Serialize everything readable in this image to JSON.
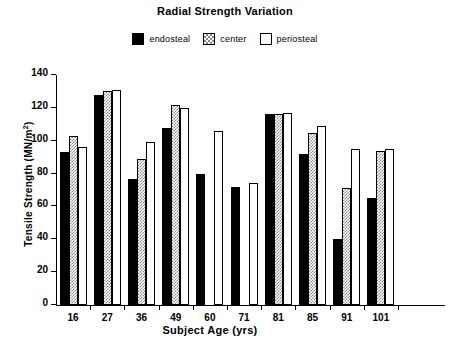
{
  "chart_data": {
    "type": "bar",
    "title": "Radial Strength Variation",
    "xlabel": "Subject Age (yrs)",
    "ylabel": "Tensile Strength (MN/m2)",
    "ylabel_base": "Tensile Strength (MN/m",
    "ylabel_sup": "2",
    "ylabel_close": ")",
    "categories": [
      "16",
      "27",
      "36",
      "49",
      "60",
      "71",
      "81",
      "85",
      "91",
      "101"
    ],
    "ylim": [
      0,
      140
    ],
    "yticks": [
      0,
      20,
      40,
      60,
      80,
      100,
      120,
      140
    ],
    "grid": false,
    "legend_position": "top-center",
    "series": [
      {
        "name": "endosteal",
        "color": "#000000",
        "pattern": "solid",
        "values": [
          93,
          128,
          77,
          108,
          80,
          72,
          116,
          92,
          40,
          65
        ]
      },
      {
        "name": "center",
        "color": "#8a8a8a",
        "pattern": "checkered",
        "values": [
          103,
          130,
          89,
          122,
          null,
          null,
          116,
          105,
          71,
          94
        ]
      },
      {
        "name": "periosteal",
        "color": "#ffffff",
        "pattern": "open",
        "values": [
          96,
          131,
          99,
          120,
          106,
          74,
          117,
          109,
          95,
          95
        ]
      }
    ]
  },
  "legend": {
    "items": [
      {
        "label": "endosteal",
        "key": "endosteal"
      },
      {
        "label": "center",
        "key": "center"
      },
      {
        "label": "periosteal",
        "key": "periosteal"
      }
    ]
  }
}
